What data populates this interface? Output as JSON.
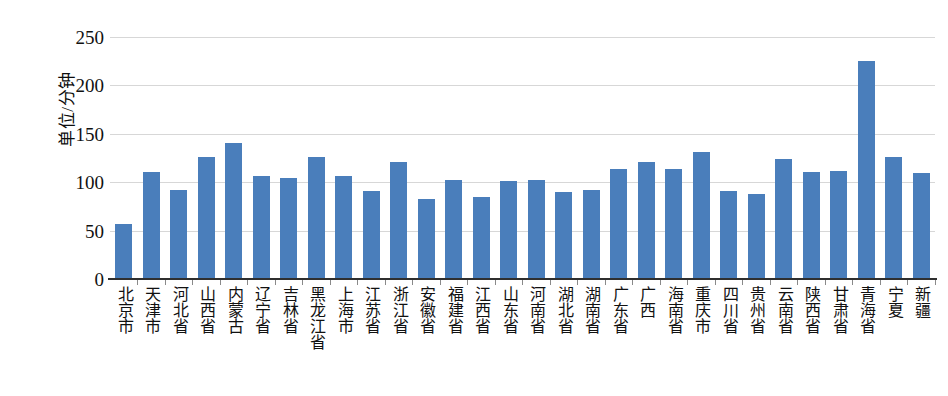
{
  "chart_data": {
    "type": "bar",
    "title": "",
    "xlabel": "",
    "ylabel": "单位/分钟",
    "ylim": [
      0,
      250
    ],
    "ytick_values": [
      250,
      200,
      150,
      100,
      50,
      0
    ],
    "ytick_labels": [
      "250",
      "200",
      "150",
      "100",
      "50",
      "0"
    ],
    "grid": true,
    "legend": "none",
    "series_color": "#4a7ebb",
    "categories": [
      "北京市",
      "天津市",
      "河北省",
      "山西省",
      "内蒙古",
      "辽宁省",
      "吉林省",
      "黑龙江省",
      "上海市",
      "江苏省",
      "浙江省",
      "安徽省",
      "福建省",
      "江西省",
      "山东省",
      "河南省",
      "湖北省",
      "湖南省",
      "广东省",
      "广西",
      "海南省",
      "重庆市",
      "四川省",
      "贵州省",
      "云南省",
      "陕西省",
      "甘肃省",
      "青海省",
      "宁夏",
      "新疆"
    ],
    "values": [
      57,
      111,
      92,
      126,
      141,
      106,
      104,
      126,
      106,
      91,
      121,
      83,
      102,
      85,
      101,
      102,
      90,
      92,
      114,
      121,
      114,
      131,
      91,
      88,
      124,
      111,
      112,
      225,
      126,
      110
    ]
  },
  "axis": {
    "y_title": "单位/分钟"
  }
}
